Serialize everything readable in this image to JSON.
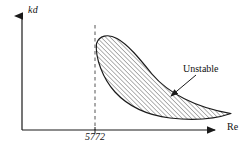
{
  "figure": {
    "type": "stability-diagram",
    "background_color": "#ffffff",
    "line_color": "#1a1a1a",
    "hatch_color": "#555555"
  },
  "axes": {
    "y_label": "kd",
    "x_label": "Re",
    "y_axis_arrow": "arrow-up",
    "x_axis_arrow": "arrow-right",
    "origin_px": [
      22,
      130
    ],
    "x_axis_end_px": [
      222,
      130
    ],
    "y_axis_top_px": [
      22,
      9
    ]
  },
  "ticks": {
    "x": [
      {
        "label": "5772",
        "x_px": 95,
        "guide": "dashed-vertical"
      }
    ]
  },
  "annotations": [
    {
      "name": "unstable-label",
      "text": "Unstable",
      "x_px": 183,
      "y_px": 63,
      "leader": "arrow-down-left"
    }
  ],
  "regions": [
    {
      "name": "unstable-region",
      "fill": "diagonal-hatch-45",
      "outline": "solid",
      "description": "Teardrop tongue rising from the dashed line at Re=5772, peaking then tapering to the right toward the Re axis."
    }
  ]
}
